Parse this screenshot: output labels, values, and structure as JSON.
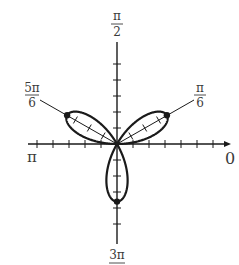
{
  "chart_data": {
    "type": "line",
    "subtype": "polar",
    "title": "",
    "curve": {
      "name": "three-petal rose",
      "equation_form": "r = a·sin(3θ)",
      "petal_directions": [
        "π/6",
        "5π/6",
        "3π/2"
      ],
      "petal_length_units": 3.6,
      "highlighted_points": [
        {
          "theta": "π/6",
          "r": 3.6
        },
        {
          "theta": "5π/6",
          "r": 3.6
        },
        {
          "theta": "3π/2",
          "r": 3.6
        }
      ],
      "color": "#1a1a1a"
    },
    "axes": {
      "polar_axis_labels": [
        {
          "angle": "0",
          "text": "0"
        },
        {
          "angle": "π/2",
          "numerator": "π",
          "denominator": "2"
        },
        {
          "angle": "π",
          "text": "π"
        },
        {
          "angle": "3π/2",
          "numerator": "3π",
          "denominator": ""
        }
      ],
      "ray_labels": [
        {
          "angle": "π/6",
          "numerator": "π",
          "denominator": "6"
        },
        {
          "angle": "5π/6",
          "numerator": "5π",
          "denominator": "6"
        }
      ],
      "tick_spacing_units": 1,
      "ticks_positive_x": 6,
      "ticks_negative_x": 5,
      "ticks_positive_y": 5,
      "ticks_negative_y": 5,
      "radial_range": [
        0,
        7
      ]
    },
    "grid": false,
    "legend": null
  },
  "labels": {
    "top_num": "π",
    "top_den": "2",
    "left": "π",
    "right": "0",
    "bottom_num": "3π",
    "ray_right_num": "π",
    "ray_right_den": "6",
    "ray_left_num": "5π",
    "ray_left_den": "6"
  },
  "colors": {
    "ink": "#1a1a1a",
    "label": "#3a3a3a",
    "background": "#ffffff"
  }
}
